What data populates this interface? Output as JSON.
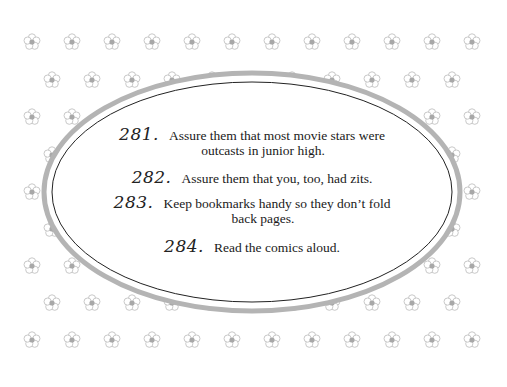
{
  "page": {
    "background": "#ffffff",
    "pattern": {
      "icon": "flower-icon",
      "petal_color": "#c9c9c9",
      "center_color": "#a8a8a8",
      "rows": [
        {
          "y": 42,
          "xs": [
            32,
            72,
            112,
            152,
            192,
            232,
            272,
            312,
            352,
            392,
            432,
            472
          ]
        },
        {
          "y": 80,
          "xs": [
            52,
            92,
            132,
            172,
            212,
            252,
            292,
            332,
            372,
            412,
            452
          ]
        },
        {
          "y": 117,
          "xs": [
            32,
            72,
            432,
            472
          ]
        },
        {
          "y": 155,
          "xs": [
            52,
            452
          ]
        },
        {
          "y": 192,
          "xs": [
            32,
            472
          ]
        },
        {
          "y": 229,
          "xs": [
            52,
            452
          ]
        },
        {
          "y": 266,
          "xs": [
            32,
            72,
            432,
            472
          ]
        },
        {
          "y": 303,
          "xs": [
            52,
            92,
            132,
            172,
            212,
            252,
            292,
            332,
            372,
            412,
            452
          ]
        },
        {
          "y": 340,
          "xs": [
            32,
            72,
            112,
            152,
            192,
            232,
            272,
            312,
            352,
            392,
            432,
            472
          ]
        }
      ]
    },
    "oval": {
      "cx": 252,
      "cy": 192,
      "outer_rx": 208,
      "outer_ry": 119,
      "inner_rx": 200,
      "inner_ry": 110,
      "outer_color": "#b4b4b4",
      "inner_color": "#222222"
    }
  },
  "tips": [
    {
      "number": "281.",
      "lines": [
        "Assure them that most movie stars were",
        "outcasts in junior high."
      ]
    },
    {
      "number": "282.",
      "lines": [
        "Assure them that you, too, had zits."
      ]
    },
    {
      "number": "283.",
      "lines": [
        "Keep bookmarks handy so they don’t fold",
        "back pages."
      ]
    },
    {
      "number": "284.",
      "lines": [
        "Read the comics aloud."
      ]
    }
  ]
}
